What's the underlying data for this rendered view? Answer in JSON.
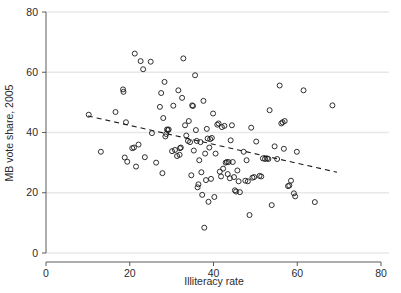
{
  "chart_data": {
    "type": "scatter",
    "title": "",
    "xlabel": "Illiteracy rate",
    "ylabel": "MB vote share, 2005",
    "xlim": [
      0,
      80
    ],
    "ylim": [
      0,
      80
    ],
    "xticks": [
      0,
      20,
      40,
      60,
      80
    ],
    "yticks": [
      0,
      20,
      40,
      60,
      80
    ],
    "xtick_labels": [
      "0",
      "20",
      "40",
      "60",
      "80"
    ],
    "ytick_labels": [
      "0",
      "20",
      "40",
      "60",
      "80"
    ],
    "grid": "horizontal",
    "legend": "none",
    "marker": "open-circle",
    "series": [
      {
        "name": "provinces",
        "points": [
          [
            10.2,
            45.9
          ],
          [
            13.1,
            33.6
          ],
          [
            16.6,
            46.8
          ],
          [
            18.4,
            54.3
          ],
          [
            18.5,
            53.5
          ],
          [
            18.8,
            31.7
          ],
          [
            19.1,
            43.4
          ],
          [
            19.4,
            30.3
          ],
          [
            20.6,
            34.8
          ],
          [
            21.0,
            35.0
          ],
          [
            21.2,
            66.2
          ],
          [
            21.5,
            28.7
          ],
          [
            22.1,
            36.0
          ],
          [
            22.6,
            63.7
          ],
          [
            23.2,
            61.0
          ],
          [
            23.6,
            31.8
          ],
          [
            25.0,
            63.5
          ],
          [
            25.3,
            39.8
          ],
          [
            26.3,
            30.0
          ],
          [
            27.2,
            48.5
          ],
          [
            27.5,
            53.1
          ],
          [
            27.8,
            26.5
          ],
          [
            28.0,
            44.8
          ],
          [
            28.3,
            56.8
          ],
          [
            28.5,
            38.7
          ],
          [
            28.7,
            39.5
          ],
          [
            28.9,
            41.0
          ],
          [
            29.1,
            40.8
          ],
          [
            29.3,
            41.0
          ],
          [
            30.1,
            33.8
          ],
          [
            30.4,
            48.9
          ],
          [
            30.8,
            34.2
          ],
          [
            31.3,
            32.2
          ],
          [
            31.6,
            54.0
          ],
          [
            31.9,
            32.6
          ],
          [
            32.0,
            34.8
          ],
          [
            32.2,
            35.0
          ],
          [
            32.5,
            51.5
          ],
          [
            32.8,
            64.6
          ],
          [
            33.2,
            42.4
          ],
          [
            33.5,
            39.0
          ],
          [
            33.9,
            37.2
          ],
          [
            34.1,
            43.8
          ],
          [
            34.4,
            36.8
          ],
          [
            34.7,
            25.8
          ],
          [
            34.9,
            49.0
          ],
          [
            35.1,
            48.8
          ],
          [
            35.3,
            34.0
          ],
          [
            35.6,
            59.0
          ],
          [
            35.8,
            40.8
          ],
          [
            36.0,
            37.2
          ],
          [
            36.2,
            21.8
          ],
          [
            36.4,
            22.8
          ],
          [
            36.6,
            30.8
          ],
          [
            36.9,
            36.8
          ],
          [
            37.1,
            26.8
          ],
          [
            37.3,
            19.3
          ],
          [
            37.6,
            50.5
          ],
          [
            37.8,
            8.4
          ],
          [
            38.0,
            33.0
          ],
          [
            38.2,
            24.2
          ],
          [
            38.4,
            41.2
          ],
          [
            38.6,
            38.0
          ],
          [
            38.8,
            17.0
          ],
          [
            39.0,
            35.0
          ],
          [
            39.2,
            37.8
          ],
          [
            39.4,
            24.6
          ],
          [
            39.6,
            38.2
          ],
          [
            39.9,
            46.3
          ],
          [
            40.2,
            18.6
          ],
          [
            40.5,
            33.0
          ],
          [
            40.9,
            42.6
          ],
          [
            41.2,
            43.0
          ],
          [
            41.5,
            27.0
          ],
          [
            41.8,
            25.4
          ],
          [
            42.0,
            41.8
          ],
          [
            42.3,
            28.0
          ],
          [
            42.6,
            42.2
          ],
          [
            42.9,
            30.0
          ],
          [
            43.2,
            30.2
          ],
          [
            43.4,
            26.2
          ],
          [
            43.6,
            30.2
          ],
          [
            43.9,
            24.8
          ],
          [
            44.1,
            37.4
          ],
          [
            44.4,
            42.4
          ],
          [
            44.6,
            30.2
          ],
          [
            44.9,
            25.2
          ],
          [
            45.1,
            20.8
          ],
          [
            45.4,
            20.4
          ],
          [
            45.7,
            27.4
          ],
          [
            46.0,
            23.8
          ],
          [
            46.3,
            20.2
          ],
          [
            47.2,
            33.6
          ],
          [
            47.6,
            24.0
          ],
          [
            47.9,
            30.8
          ],
          [
            48.2,
            23.8
          ],
          [
            48.6,
            12.6
          ],
          [
            49.0,
            41.6
          ],
          [
            49.3,
            25.0
          ],
          [
            49.7,
            25.2
          ],
          [
            50.2,
            37.0
          ],
          [
            51.0,
            25.6
          ],
          [
            51.4,
            25.4
          ],
          [
            51.8,
            31.4
          ],
          [
            52.3,
            31.2
          ],
          [
            52.8,
            31.4
          ],
          [
            53.1,
            31.2
          ],
          [
            53.4,
            47.4
          ],
          [
            53.9,
            15.9
          ],
          [
            54.6,
            35.4
          ],
          [
            55.2,
            31.2
          ],
          [
            55.8,
            55.6
          ],
          [
            56.2,
            43.0
          ],
          [
            56.5,
            43.4
          ],
          [
            56.8,
            34.6
          ],
          [
            57.0,
            43.8
          ],
          [
            57.8,
            22.2
          ],
          [
            58.1,
            22.4
          ],
          [
            58.5,
            24.0
          ],
          [
            59.2,
            19.8
          ],
          [
            59.5,
            18.8
          ],
          [
            59.9,
            33.6
          ],
          [
            61.5,
            54.0
          ],
          [
            64.2,
            16.9
          ],
          [
            68.4,
            49.0
          ]
        ]
      }
    ],
    "fit_line": {
      "name": "linear fit",
      "style": "dashed",
      "x_start": 10.0,
      "y_start": 45.5,
      "x_end": 69.5,
      "y_end": 26.8
    }
  },
  "axes": {
    "x_axis_name": "Illiteracy rate",
    "y_axis_name": "MB vote share, 2005"
  }
}
